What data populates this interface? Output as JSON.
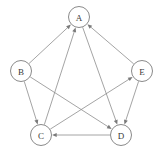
{
  "figure": {
    "background_color": "#ffffff",
    "node_stroke_color": "#8a8a8a",
    "node_fill_color": "#ffffff",
    "edge_color": "#8d8d8d",
    "label_color": "#3a3a3a",
    "arrowhead_color": "#7a7a7a",
    "width": 158,
    "height": 153
  },
  "graph": {
    "directed": true,
    "node_radius": 10.5,
    "nodes": [
      {
        "id": "A",
        "label": "A",
        "x": 79,
        "y": 17
      },
      {
        "id": "B",
        "label": "B",
        "x": 21,
        "y": 71
      },
      {
        "id": "E",
        "label": "E",
        "x": 142,
        "y": 71
      },
      {
        "id": "C",
        "label": "C",
        "x": 41,
        "y": 135
      },
      {
        "id": "D",
        "label": "D",
        "x": 121,
        "y": 135
      }
    ],
    "edges": [
      {
        "id": "B-A",
        "from": "B",
        "to": "A",
        "directed": true
      },
      {
        "id": "C-A",
        "from": "C",
        "to": "A",
        "directed": true
      },
      {
        "id": "E-A",
        "from": "E",
        "to": "A",
        "directed": true
      },
      {
        "id": "B-C",
        "from": "B",
        "to": "C",
        "directed": true
      },
      {
        "id": "B-D",
        "from": "B",
        "to": "D",
        "directed": true
      },
      {
        "id": "C-E",
        "from": "C",
        "to": "E",
        "directed": true
      },
      {
        "id": "A-D",
        "from": "A",
        "to": "D",
        "directed": true
      },
      {
        "id": "E-D",
        "from": "E",
        "to": "D",
        "directed": true
      },
      {
        "id": "D-C",
        "from": "D",
        "to": "C",
        "directed": true
      }
    ]
  }
}
